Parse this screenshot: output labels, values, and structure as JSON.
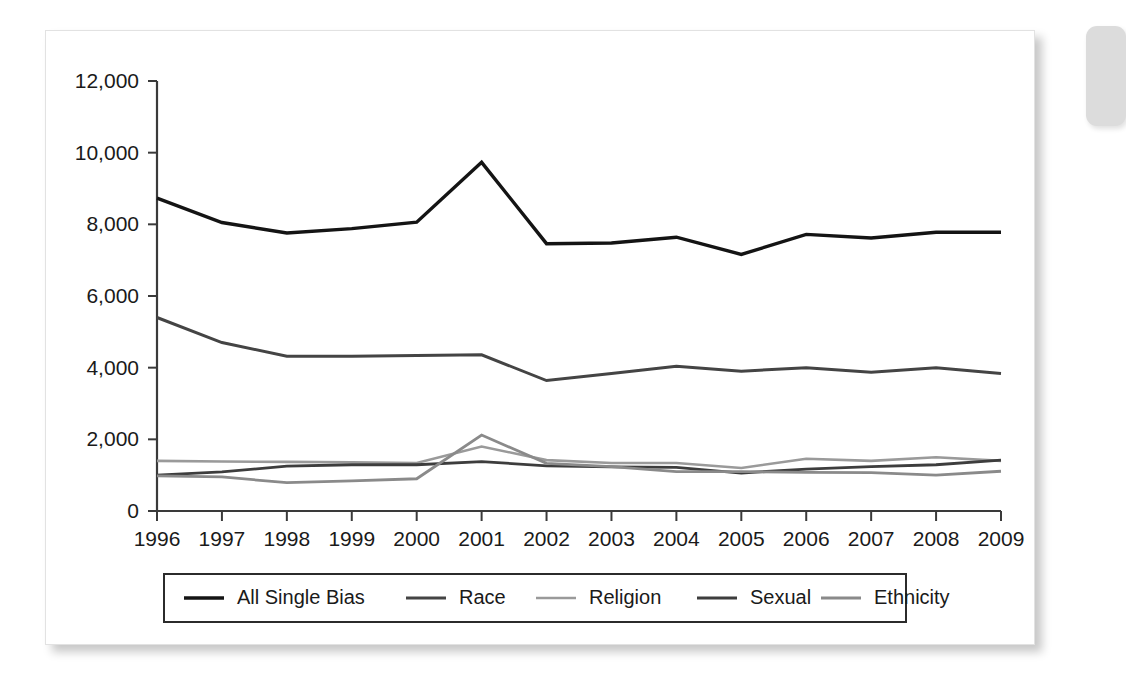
{
  "figure": {
    "card_background": "#ffffff",
    "page_background": "#ffffff",
    "side_tab_color": "#dcdcdc"
  },
  "chart_data": {
    "type": "line",
    "title": "",
    "subtitle": "",
    "xlabel": "",
    "ylabel": "",
    "x": [
      1996,
      1997,
      1998,
      1999,
      2000,
      2001,
      2002,
      2003,
      2004,
      2005,
      2006,
      2007,
      2008,
      2009
    ],
    "categories": [
      "1996",
      "1997",
      "1998",
      "1999",
      "2000",
      "2001",
      "2002",
      "2003",
      "2004",
      "2005",
      "2006",
      "2007",
      "2008",
      "2009"
    ],
    "xlim": [
      1996,
      2009
    ],
    "ylim": [
      0,
      12000
    ],
    "y_ticks": [
      0,
      2000,
      4000,
      6000,
      8000,
      10000,
      12000
    ],
    "y_tick_labels": [
      "0",
      "2,000",
      "4,000",
      "6,000",
      "8,000",
      "10,000",
      "12,000"
    ],
    "x_tick_labels": [
      "1996",
      "1997",
      "1998",
      "1999",
      "2000",
      "2001",
      "2002",
      "2003",
      "2004",
      "2005",
      "2006",
      "2007",
      "2008",
      "2009"
    ],
    "grid": false,
    "legend_position": "bottom",
    "series": [
      {
        "name": "All Single Bias",
        "color": "#141414",
        "width": 3.4,
        "values": [
          8730,
          8050,
          7760,
          7880,
          8060,
          9730,
          7460,
          7480,
          7640,
          7160,
          7720,
          7620,
          7780,
          7780
        ]
      },
      {
        "name": "Race",
        "color": "#444444",
        "width": 3.0,
        "values": [
          5400,
          4700,
          4320,
          4320,
          4340,
          4360,
          3640,
          3840,
          4040,
          3900,
          4000,
          3870,
          4000,
          3840
        ]
      },
      {
        "name": "Religion",
        "color": "#9a9a9a",
        "width": 2.6,
        "values": [
          1400,
          1380,
          1370,
          1360,
          1340,
          1800,
          1420,
          1340,
          1340,
          1200,
          1460,
          1400,
          1500,
          1400
        ]
      },
      {
        "name": "Sexual",
        "color": "#3d3d3d",
        "width": 2.8,
        "values": [
          1000,
          1090,
          1250,
          1290,
          1290,
          1380,
          1260,
          1230,
          1220,
          1060,
          1170,
          1240,
          1290,
          1420
        ]
      },
      {
        "name": "Ethnicity",
        "color": "#8a8a8a",
        "width": 2.8,
        "values": [
          980,
          950,
          790,
          840,
          900,
          2120,
          1330,
          1240,
          1100,
          1100,
          1080,
          1070,
          1000,
          1110
        ]
      }
    ],
    "legend_entries": [
      {
        "label": "All Single Bias",
        "color": "#141414",
        "width": 3.4
      },
      {
        "label": "Race",
        "color": "#444444",
        "width": 3.0
      },
      {
        "label": "Religion",
        "color": "#9a9a9a",
        "width": 2.6
      },
      {
        "label": "Sexual",
        "color": "#3d3d3d",
        "width": 2.8
      },
      {
        "label": "Ethnicity",
        "color": "#8a8a8a",
        "width": 2.8
      }
    ]
  }
}
